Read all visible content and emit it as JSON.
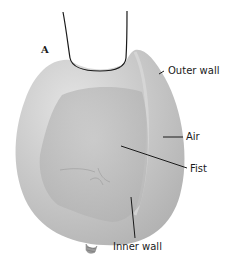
{
  "figure": {
    "panel_letter": "A",
    "labels": {
      "outer_wall": "Outer wall",
      "air": "Air",
      "fist": "Fist",
      "inner_wall": "Inner wall"
    },
    "colors": {
      "balloon": "#c4c4c4",
      "balloon_highlight": "#e2e2e2",
      "fist": "#bababa",
      "outline": "#1a1a1a"
    }
  }
}
